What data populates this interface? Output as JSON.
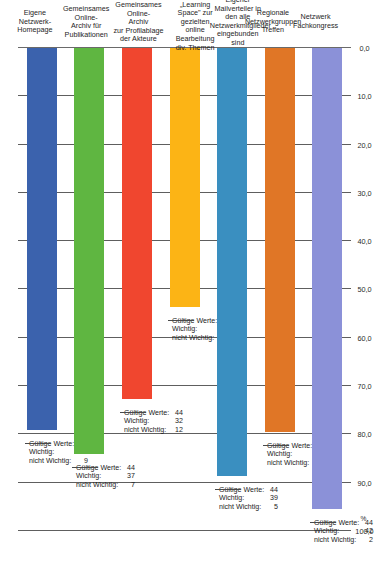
{
  "chart_data": {
    "type": "bar",
    "orientation": "vertical-rotated",
    "title": "",
    "xlabel": "",
    "ylabel": "%",
    "ylim": [
      0.0,
      100.0
    ],
    "grid": true,
    "axis_unit": "%",
    "tick_labels": [
      "0,0",
      "10,0",
      "20,0",
      "30,0",
      "40,0",
      "50,0",
      "60,0",
      "70,0",
      "80,0",
      "90,0",
      "100,0"
    ],
    "tick_values": [
      0.0,
      10.0,
      20.0,
      30.0,
      40.0,
      50.0,
      60.0,
      70.0,
      80.0,
      90.0,
      100.0
    ],
    "categories": [
      "Eigene Netzwerk-\nHomepage",
      "Gemeinsames Online-\nArchiv für\nPublikationen",
      "Gemeinsames Online-\nArchiv\nzur Profilablage\nder Akteure",
      "Eigener „Learning\nSpace\" zur gezielten\nonline Bearbeitung\ndiv. Themen",
      "Eigener Mailverteiler in\nden alle\nNetzwerkmitglieder\neingebunden sind",
      "Regionale\nNetzwerkgruppen\nTreffen",
      "Netzwerk Fachkongress"
    ],
    "values": [
      79.1,
      84.1,
      72.7,
      53.7,
      88.6,
      79.5,
      95.5
    ],
    "colors": [
      "#3b62ad",
      "#5fb641",
      "#f0462f",
      "#fcb415",
      "#3a8fc0",
      "#e07626",
      "#8b91d8"
    ],
    "annotation_labels": [
      "Gültige Werte:",
      "Wichtig:",
      "nicht Wichtig:"
    ],
    "annotations": [
      {
        "gueltige_werte": "43",
        "wichtig": "34",
        "nicht_wichtig": "9"
      },
      {
        "gueltige_werte": "44",
        "wichtig": "37",
        "nicht_wichtig": "7"
      },
      {
        "gueltige_werte": "44",
        "wichtig": "32",
        "nicht_wichtig": "12"
      },
      {
        "gueltige_werte": "41",
        "wichtig": "22",
        "nicht_wichtig": "19"
      },
      {
        "gueltige_werte": "44",
        "wichtig": "39",
        "nicht_wichtig": "5"
      },
      {
        "gueltige_werte": "44",
        "wichtig": "35",
        "nicht_wichtig": "9"
      },
      {
        "gueltige_werte": "44",
        "wichtig": "42",
        "nicht_wichtig": "2"
      }
    ]
  }
}
